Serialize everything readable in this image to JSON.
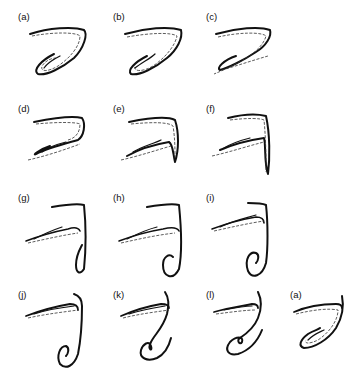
{
  "figure": {
    "panels": [
      {
        "id": "a1",
        "label": "(a)",
        "left": 18,
        "top": 12,
        "stage": 0
      },
      {
        "id": "b",
        "label": "(b)",
        "left": 113,
        "top": 12,
        "stage": 1
      },
      {
        "id": "c",
        "label": "(c)",
        "left": 206,
        "top": 12,
        "stage": 2
      },
      {
        "id": "d",
        "label": "(d)",
        "left": 18,
        "top": 104,
        "stage": 3
      },
      {
        "id": "e",
        "label": "(e)",
        "left": 113,
        "top": 104,
        "stage": 4
      },
      {
        "id": "f",
        "label": "(f)",
        "left": 206,
        "top": 104,
        "stage": 5
      },
      {
        "id": "g",
        "label": "(g)",
        "left": 18,
        "top": 193,
        "stage": 6
      },
      {
        "id": "h",
        "label": "(h)",
        "left": 113,
        "top": 193,
        "stage": 7
      },
      {
        "id": "i",
        "label": "(i)",
        "left": 206,
        "top": 193,
        "stage": 8
      },
      {
        "id": "j",
        "label": "(j)",
        "left": 18,
        "top": 290,
        "stage": 9
      },
      {
        "id": "k",
        "label": "(k)",
        "left": 113,
        "top": 290,
        "stage": 10
      },
      {
        "id": "l",
        "label": "(l)",
        "left": 206,
        "top": 290,
        "stage": 11
      },
      {
        "id": "a2",
        "label": "(a)",
        "left": 290,
        "top": 290,
        "stage": 12
      }
    ],
    "ink_color": "#111111",
    "background": "#ffffff"
  }
}
